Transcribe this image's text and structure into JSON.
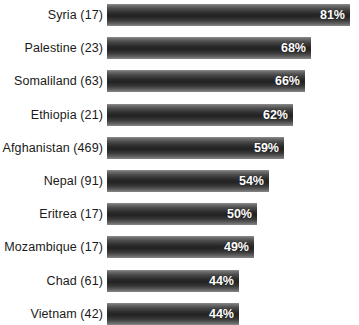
{
  "chart_data": {
    "type": "bar",
    "orientation": "horizontal",
    "title": "",
    "subtitle": "",
    "xlabel": "",
    "ylabel": "",
    "xlim": [
      0,
      100
    ],
    "grid": false,
    "legend": null,
    "value_suffix": "%",
    "value_label_position": "inside-end",
    "bar_color_top": "#8e8e8e",
    "bar_color_mid": "#222222",
    "bar_color_bottom": "#878787",
    "background_color": "#ffffff",
    "label_color": "#1a1a1a",
    "value_color": "#ffffff",
    "pixels_per_percent": 3.0,
    "categories": [
      "Syria (17)",
      "Palestine (23)",
      "Somaliland (63)",
      "Ethiopia (21)",
      "Afghanistan (469)",
      "Nepal (91)",
      "Eritrea (17)",
      "Mozambique (17)",
      "Chad (61)",
      "Vietnam (42)"
    ],
    "values": [
      81,
      68,
      66,
      62,
      59,
      54,
      50,
      49,
      44,
      44
    ],
    "value_labels": [
      "81%",
      "68%",
      "66%",
      "62%",
      "59%",
      "54%",
      "50%",
      "49%",
      "44%",
      "44%"
    ],
    "sample_sizes": [
      17,
      23,
      63,
      21,
      469,
      91,
      17,
      17,
      61,
      42
    ],
    "bars": [
      {
        "category": "Syria (17)",
        "value": 81,
        "label": "81%"
      },
      {
        "category": "Palestine (23)",
        "value": 68,
        "label": "68%"
      },
      {
        "category": "Somaliland (63)",
        "value": 66,
        "label": "66%"
      },
      {
        "category": "Ethiopia (21)",
        "value": 62,
        "label": "62%"
      },
      {
        "category": "Afghanistan (469)",
        "value": 59,
        "label": "59%"
      },
      {
        "category": "Nepal (91)",
        "value": 54,
        "label": "54%"
      },
      {
        "category": "Eritrea (17)",
        "value": 50,
        "label": "50%"
      },
      {
        "category": "Mozambique (17)",
        "value": 49,
        "label": "49%"
      },
      {
        "category": "Chad (61)",
        "value": 44,
        "label": "44%"
      },
      {
        "category": "Vietnam (42)",
        "value": 44,
        "label": "44%"
      }
    ]
  }
}
